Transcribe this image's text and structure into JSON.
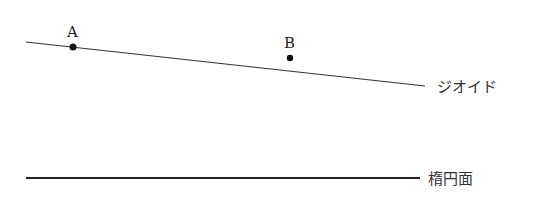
{
  "diagram": {
    "points": [
      {
        "id": "A",
        "label": "A"
      },
      {
        "id": "B",
        "label": "B"
      }
    ],
    "lines": {
      "geoid": {
        "label": "ジオイド"
      },
      "ellipsoid": {
        "label": "楕円面"
      }
    },
    "colors": {
      "line": "#333333",
      "point": "#111111",
      "text": "#222222"
    }
  }
}
